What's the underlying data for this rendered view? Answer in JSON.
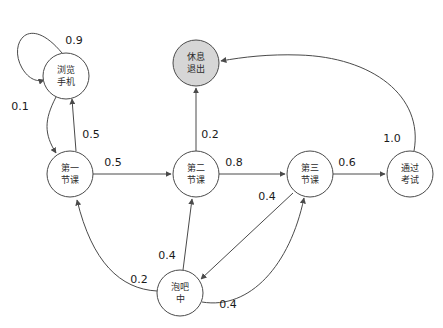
{
  "diagram": {
    "type": "markov-chain-state-diagram",
    "colors": {
      "node_fill": "#ffffff",
      "terminal_fill": "#d6d6d6",
      "stroke": "#4a4a4a",
      "label_text": "#2b2b2b",
      "weight_text": "#1a1a1a",
      "background": "#ffffff"
    },
    "nodes": [
      {
        "id": "browse-phone",
        "line1": "浏览",
        "line2": "手机",
        "cx": 66,
        "cy": 76,
        "r": 23,
        "terminal": false
      },
      {
        "id": "rest-exit",
        "line1": "休息",
        "line2": "退出",
        "cx": 196,
        "cy": 63,
        "r": 23,
        "terminal": true
      },
      {
        "id": "class-one",
        "line1": "第一",
        "line2": "节课",
        "cx": 70,
        "cy": 174,
        "r": 23,
        "terminal": false
      },
      {
        "id": "class-two",
        "line1": "第二",
        "line2": "节课",
        "cx": 196,
        "cy": 174,
        "r": 23,
        "terminal": false
      },
      {
        "id": "class-three",
        "line1": "第三",
        "line2": "节课",
        "cx": 310,
        "cy": 174,
        "r": 23,
        "terminal": false
      },
      {
        "id": "pass-exam",
        "line1": "通过",
        "line2": "考试",
        "cx": 410,
        "cy": 174,
        "r": 23,
        "terminal": false
      },
      {
        "id": "at-bar",
        "line1": "泡吧",
        "line2": "中",
        "cx": 180,
        "cy": 293,
        "r": 23,
        "terminal": false
      }
    ],
    "edges": [
      {
        "id": "browse-phone-self-loop",
        "from": "browse-phone",
        "to": "browse-phone",
        "weight": "0.9",
        "label_x": 74,
        "label_y": 41
      },
      {
        "id": "browse-phone-to-class-one",
        "from": "browse-phone",
        "to": "class-one",
        "weight": "0.1",
        "label_x": 20,
        "label_y": 107
      },
      {
        "id": "class-one-to-browse-phone",
        "from": "class-one",
        "to": "browse-phone",
        "weight": "0.5",
        "label_x": 91,
        "label_y": 135
      },
      {
        "id": "class-one-to-class-two",
        "from": "class-one",
        "to": "class-two",
        "weight": "0.5",
        "label_x": 113,
        "label_y": 163
      },
      {
        "id": "class-two-to-rest-exit",
        "from": "class-two",
        "to": "rest-exit",
        "weight": "0.2",
        "label_x": 210,
        "label_y": 135
      },
      {
        "id": "class-two-to-class-three",
        "from": "class-two",
        "to": "class-three",
        "weight": "0.8",
        "label_x": 234,
        "label_y": 163
      },
      {
        "id": "class-three-to-pass-exam",
        "from": "class-three",
        "to": "pass-exam",
        "weight": "0.6",
        "label_x": 347,
        "label_y": 163
      },
      {
        "id": "pass-exam-to-rest-exit",
        "from": "pass-exam",
        "to": "rest-exit",
        "weight": "1.0",
        "label_x": 392,
        "label_y": 139
      },
      {
        "id": "class-three-to-at-bar",
        "from": "class-three",
        "to": "at-bar",
        "weight": "0.4",
        "label_x": 267,
        "label_y": 197
      },
      {
        "id": "at-bar-to-class-three",
        "from": "at-bar",
        "to": "class-three",
        "weight": "0.4",
        "label_x": 228,
        "label_y": 305
      },
      {
        "id": "at-bar-to-class-two",
        "from": "at-bar",
        "to": "class-two",
        "weight": "0.4",
        "label_x": 167,
        "label_y": 256
      },
      {
        "id": "at-bar-to-class-one",
        "from": "at-bar",
        "to": "class-one",
        "weight": "0.2",
        "label_x": 139,
        "label_y": 280
      }
    ]
  }
}
